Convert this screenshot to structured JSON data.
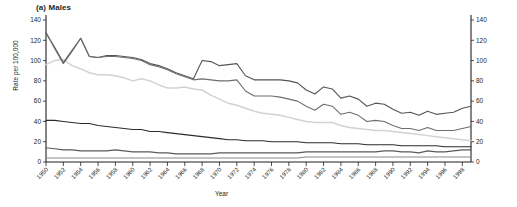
{
  "panel": {
    "title": "(a) Males"
  },
  "axes": {
    "ylabel_left": "Rate per 100,000",
    "xlabel": "Year",
    "y_ticks": [
      0,
      20,
      40,
      60,
      80,
      100,
      120,
      140
    ],
    "y_ticks_right": [
      0,
      20,
      40,
      60,
      80,
      100,
      120,
      140
    ],
    "x_tick_labels": [
      "1950",
      "1952",
      "1954",
      "1956",
      "1958",
      "1960",
      "1962",
      "1964",
      "1966",
      "1968",
      "1970",
      "1972",
      "1974",
      "1976",
      "1978",
      "1980",
      "1982",
      "1984",
      "1986",
      "1988",
      "1990",
      "1992",
      "1994",
      "1996",
      "1998"
    ]
  },
  "colors": {
    "series_1": "#555555",
    "series_2": "#d2d2d2",
    "series_3": "#6e6e6e",
    "series_4": "#2b2b2b",
    "series_5": "#5a5a5a",
    "series_6": "#8a8a8a",
    "axis": "#231f20",
    "background": "#ffffff"
  },
  "chart_data": {
    "type": "line",
    "title": "(a) Males",
    "xlabel": "Year",
    "ylabel": "Rate per 100,000",
    "ylim": [
      0,
      140
    ],
    "xlim": [
      1950,
      1999
    ],
    "grid": false,
    "legend": "none",
    "x": [
      1950,
      1951,
      1952,
      1953,
      1954,
      1955,
      1956,
      1957,
      1958,
      1959,
      1960,
      1961,
      1962,
      1963,
      1964,
      1965,
      1966,
      1967,
      1968,
      1969,
      1970,
      1971,
      1972,
      1973,
      1974,
      1975,
      1976,
      1977,
      1978,
      1979,
      1980,
      1981,
      1982,
      1983,
      1984,
      1985,
      1986,
      1987,
      1988,
      1989,
      1990,
      1991,
      1992,
      1993,
      1994,
      1995,
      1996,
      1997,
      1998,
      1999
    ],
    "series": [
      {
        "name": "series_1",
        "color": "#555555",
        "values": [
          127,
          113,
          98,
          110,
          122,
          104,
          103,
          105,
          105,
          104,
          103,
          101,
          97,
          95,
          92,
          88,
          85,
          82,
          100,
          99,
          95,
          96,
          97,
          85,
          81,
          81,
          81,
          81,
          80,
          78,
          71,
          67,
          74,
          72,
          63,
          65,
          62,
          55,
          58,
          57,
          52,
          48,
          49,
          46,
          50,
          47,
          48,
          49,
          53,
          55
        ]
      },
      {
        "name": "series_2",
        "color": "#d2d2d2",
        "values": [
          96,
          100,
          101,
          95,
          92,
          88,
          86,
          86,
          85,
          83,
          80,
          82,
          80,
          76,
          73,
          73,
          74,
          72,
          71,
          66,
          62,
          58,
          56,
          53,
          50,
          48,
          47,
          46,
          44,
          42,
          40,
          39,
          39,
          39,
          36,
          34,
          33,
          32,
          31,
          31,
          30,
          29,
          28,
          27,
          26,
          25,
          24,
          23,
          22,
          21
        ]
      },
      {
        "name": "series_3",
        "color": "#6e6e6e",
        "values": [
          128,
          112,
          97,
          109,
          122,
          104,
          103,
          104,
          104,
          103,
          102,
          100,
          96,
          94,
          91,
          87,
          84,
          81,
          82,
          81,
          80,
          80,
          81,
          70,
          65,
          65,
          65,
          64,
          62,
          60,
          55,
          51,
          57,
          55,
          47,
          49,
          46,
          40,
          41,
          40,
          36,
          33,
          33,
          31,
          34,
          31,
          31,
          31,
          33,
          35
        ]
      },
      {
        "name": "series_4",
        "color": "#2b2b2b",
        "values": [
          41,
          41,
          40,
          39,
          38,
          38,
          36,
          35,
          34,
          33,
          32,
          32,
          30,
          30,
          29,
          28,
          27,
          26,
          25,
          24,
          23,
          22,
          22,
          21,
          21,
          21,
          20,
          20,
          20,
          20,
          19,
          19,
          19,
          19,
          18,
          18,
          18,
          17,
          17,
          17,
          17,
          16,
          16,
          16,
          16,
          16,
          15,
          15,
          15,
          15
        ]
      },
      {
        "name": "series_5",
        "color": "#5a5a5a",
        "values": [
          14,
          13,
          12,
          12,
          11,
          11,
          11,
          11,
          12,
          11,
          10,
          10,
          10,
          9,
          9,
          8,
          8,
          8,
          8,
          8,
          9,
          9,
          9,
          9,
          9,
          9,
          9,
          9,
          9,
          9,
          10,
          10,
          10,
          10,
          10,
          10,
          10,
          10,
          10,
          11,
          11,
          10,
          10,
          9,
          11,
          10,
          10,
          11,
          12,
          12
        ]
      },
      {
        "name": "series_6",
        "color": "#8a8a8a",
        "values": [
          4,
          4,
          4,
          4,
          4,
          4,
          4,
          4,
          4,
          4,
          4,
          4,
          4,
          4,
          4,
          4,
          4,
          4,
          4,
          4,
          4,
          4,
          4,
          4,
          4,
          4,
          4,
          4,
          4,
          4,
          5,
          5,
          5,
          5,
          5,
          5,
          5,
          5,
          5,
          5,
          5,
          5,
          5,
          5,
          5,
          5,
          5,
          5,
          5,
          5
        ]
      }
    ]
  }
}
